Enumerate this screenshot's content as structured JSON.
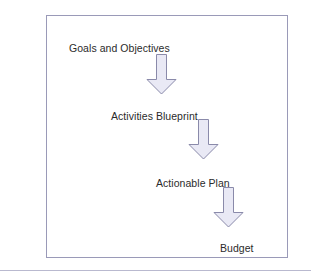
{
  "diagram": {
    "title": "",
    "frame": {
      "border_color": "#9a9ab8",
      "background": "#ffffff"
    },
    "arrow_style": {
      "fill": "#e9e9f5",
      "stroke": "#8a8aaa",
      "direction": "down"
    },
    "text_color": "#2b2b2b",
    "steps": [
      {
        "label": "Goals and Objectives",
        "arrow_name": "arrow-goals-to-activities"
      },
      {
        "label": "Activities Blueprint",
        "arrow_name": "arrow-activities-to-plan"
      },
      {
        "label": "Actionable Plan",
        "arrow_name": "arrow-plan-to-budget"
      },
      {
        "label": "Budget",
        "arrow_name": ""
      }
    ]
  },
  "page": {
    "rule_color": "#b9b9cf"
  }
}
